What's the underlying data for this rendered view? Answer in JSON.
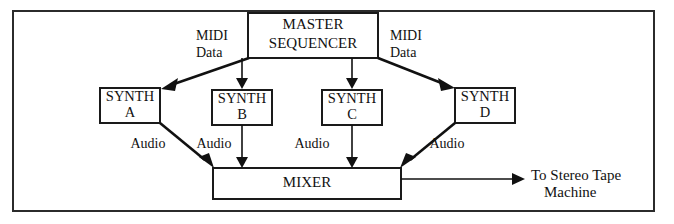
{
  "diagram": {
    "frame": {
      "visible": true,
      "color": "#2b2b2b"
    },
    "nodes": {
      "sequencer": {
        "line1": "MASTER",
        "line2": "SEQUENCER"
      },
      "synth_a": {
        "line1": "SYNTH",
        "line2": "A"
      },
      "synth_b": {
        "line1": "SYNTH",
        "line2": "B"
      },
      "synth_c": {
        "line1": "SYNTH",
        "line2": "C"
      },
      "synth_d": {
        "line1": "SYNTH",
        "line2": "D"
      },
      "mixer": {
        "label": "MIXER"
      }
    },
    "edge_labels": {
      "midi_left": {
        "line1": "MIDI",
        "line2": "Data"
      },
      "midi_right": {
        "line1": "MIDI",
        "line2": "Data"
      },
      "audio_a": "Audio",
      "audio_b": "Audio",
      "audio_c": "Audio",
      "audio_d": "Audio"
    },
    "output": {
      "line1": "To Stereo Tape",
      "line2": "Machine"
    },
    "colors": {
      "stroke": "#111111",
      "box_stroke": "#1a1a1a",
      "background": "#ffffff"
    }
  }
}
